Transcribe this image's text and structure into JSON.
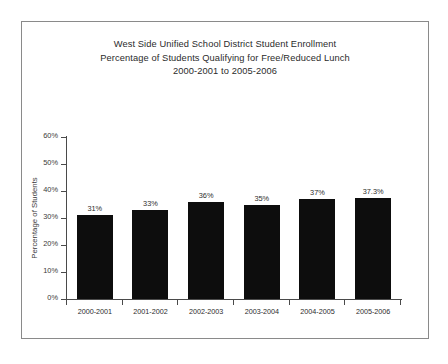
{
  "chart_data": {
    "type": "bar",
    "title": "West Side Unified School District Student Enrollment",
    "subtitle": "Percentage of Students Qualifying for Free/Reduced Lunch",
    "subtitle2": "2000-2001 to 2005-2006",
    "title_lines": [
      "West Side Unified School District Student Enrollment",
      "Percentage of Students Qualifying for Free/Reduced Lunch",
      "2000-2001 to 2005-2006"
    ],
    "xlabel": "",
    "ylabel": "Percentage of Students",
    "categories": [
      "2000-2001",
      "2001-2002",
      "2002-2003",
      "2003-2004",
      "2004-2005",
      "2005-2006"
    ],
    "values": [
      31,
      33,
      36,
      35,
      37,
      37.3
    ],
    "data_labels": [
      "31%",
      "33%",
      "36%",
      "35%",
      "37%",
      "37.3%"
    ],
    "ylim": [
      0,
      60
    ],
    "ytick_values": [
      60,
      50,
      40,
      30,
      20,
      10,
      0
    ],
    "ytick_labels": [
      "60%",
      "50%",
      "40%",
      "30%",
      "20%",
      "10%",
      "0%"
    ],
    "grid": false,
    "legend": false,
    "bar_color": "#0d0d0d",
    "axis_color": "#4a4a4a",
    "text_color": "#2b2b2b",
    "background_color": "#ffffff",
    "border_color": "#8a8a8a"
  }
}
